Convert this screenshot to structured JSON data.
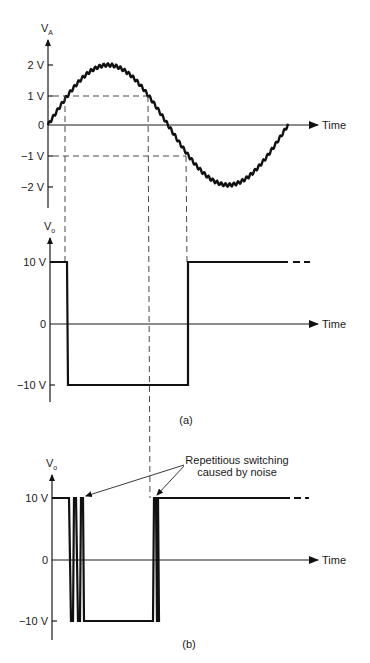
{
  "chart_data": {
    "type": "line",
    "panels": [
      {
        "id": "input",
        "ylabel": "V_A",
        "ylabel_main": "V",
        "ylabel_sub": "A",
        "xlabel": "Time",
        "yticks": [
          "2 V",
          "1 V",
          "0",
          "-1 V",
          "-2 V"
        ],
        "ytick_values": [
          2,
          1,
          0,
          -1,
          -2
        ],
        "series": [
          {
            "name": "V_A (noisy sine)",
            "amplitude": 2,
            "unit": "V",
            "cycles": 1,
            "noise": "small high-frequency ripple"
          }
        ],
        "reference_levels": [
          1,
          -1
        ]
      },
      {
        "id": "output_a",
        "caption": "(a)",
        "ylabel": "V_o",
        "ylabel_main": "V",
        "ylabel_sub": "o",
        "xlabel": "Time",
        "yticks": [
          "10 V",
          "0",
          "-10 V"
        ],
        "ytick_values": [
          10,
          0,
          -10
        ],
        "series": [
          {
            "name": "V_o",
            "levels": [
              10,
              -10,
              10
            ],
            "transitions": [
              "V_A rises above 1 V",
              "V_A falls below -1 V"
            ]
          }
        ]
      },
      {
        "id": "output_b",
        "caption": "(b)",
        "ylabel": "V_o",
        "ylabel_main": "V",
        "ylabel_sub": "o",
        "xlabel": "Time",
        "yticks": [
          "10 V",
          "0",
          "-10 V"
        ],
        "ytick_values": [
          10,
          0,
          -10
        ],
        "series": [
          {
            "name": "V_o",
            "levels": [
              10,
              -10,
              10
            ],
            "note": "multiple rapid transitions at each crossing"
          }
        ],
        "annotation": {
          "line1": "Repetitious switching",
          "line2": "caused by noise"
        }
      }
    ]
  },
  "labels": {
    "va_main": "V",
    "va_sub": "A",
    "vo_main": "V",
    "vo_sub": "o",
    "time": "Time",
    "tick_2v": "2 V",
    "tick_1v": "1 V",
    "tick_0": "0",
    "tick_m1v": "−1 V",
    "tick_m2v": "−2 V",
    "tick_10v": "10 V",
    "tick_m10v": "−10 V",
    "caption_a": "(a)",
    "caption_b": "(b)",
    "annotation_line1": "Repetitious switching",
    "annotation_line2": "caused by noise"
  }
}
